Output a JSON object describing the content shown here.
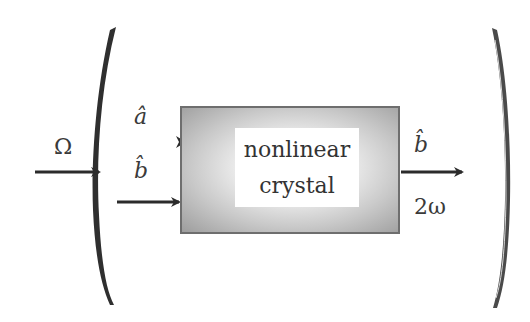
{
  "diagram": {
    "crystal": {
      "line1": "nonlinear",
      "line2": "crystal"
    },
    "labels": {
      "pump_frequency": "Ω",
      "mode_a": "â",
      "mode_b_in": "b̂",
      "mode_b_out": "b̂",
      "output_frequency": "2ω"
    },
    "colors": {
      "stroke": "#2b2b2b",
      "mirror": "#3c3c3c",
      "crystal_border": "#6e6e6e",
      "crystal_edge": "#9d9d9d",
      "background": "#ffffff"
    }
  }
}
